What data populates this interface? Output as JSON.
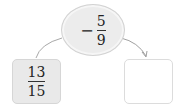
{
  "operator": {
    "sign": "−",
    "numerator": "5",
    "denominator": "9"
  },
  "input_box": {
    "numerator": "13",
    "denominator": "15"
  },
  "output_box": {
    "value": ""
  },
  "colors": {
    "ellipse_fill": "#ececec",
    "box_fill": "#e9e9e9",
    "border": "#d2d2d2",
    "arrow": "#9a9a9a"
  }
}
